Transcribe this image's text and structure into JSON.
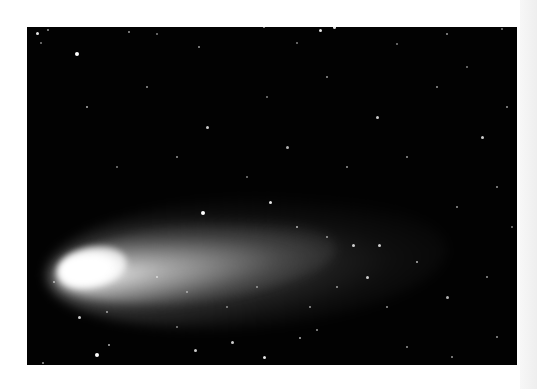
{
  "image": {
    "subject": "Comet with bright nucleus and long tail against a starfield",
    "border_color": "#ffffff",
    "sky_color": "#020202",
    "comet_color": "#ffffff"
  },
  "stars": [
    {
      "x": 10,
      "y": 6,
      "r": 1.5,
      "o": 0.9
    },
    {
      "x": 21,
      "y": 3,
      "r": 1,
      "o": 0.6
    },
    {
      "x": 50,
      "y": 27,
      "r": 2,
      "o": 1
    },
    {
      "x": 102,
      "y": 5,
      "r": 1,
      "o": 0.6
    },
    {
      "x": 130,
      "y": 7,
      "r": 1,
      "o": 0.5
    },
    {
      "x": 172,
      "y": 20,
      "r": 1,
      "o": 0.6
    },
    {
      "x": 237,
      "y": 0,
      "r": 1,
      "o": 0.7
    },
    {
      "x": 293,
      "y": 3,
      "r": 1.5,
      "o": 0.9
    },
    {
      "x": 307,
      "y": 0,
      "r": 1.5,
      "o": 0.9
    },
    {
      "x": 420,
      "y": 7,
      "r": 1,
      "o": 0.6
    },
    {
      "x": 475,
      "y": 2,
      "r": 1,
      "o": 0.5
    },
    {
      "x": 270,
      "y": 16,
      "r": 1,
      "o": 0.5
    },
    {
      "x": 370,
      "y": 17,
      "r": 1,
      "o": 0.5
    },
    {
      "x": 14,
      "y": 16,
      "r": 1,
      "o": 0.5
    },
    {
      "x": 60,
      "y": 80,
      "r": 1,
      "o": 0.7
    },
    {
      "x": 120,
      "y": 60,
      "r": 1,
      "o": 0.6
    },
    {
      "x": 180,
      "y": 100,
      "r": 1.5,
      "o": 0.8
    },
    {
      "x": 240,
      "y": 70,
      "r": 1,
      "o": 0.5
    },
    {
      "x": 300,
      "y": 50,
      "r": 1,
      "o": 0.6
    },
    {
      "x": 350,
      "y": 90,
      "r": 1.5,
      "o": 0.8
    },
    {
      "x": 410,
      "y": 60,
      "r": 1,
      "o": 0.6
    },
    {
      "x": 455,
      "y": 110,
      "r": 1.5,
      "o": 0.8
    },
    {
      "x": 470,
      "y": 160,
      "r": 1,
      "o": 0.6
    },
    {
      "x": 90,
      "y": 140,
      "r": 1,
      "o": 0.5
    },
    {
      "x": 150,
      "y": 130,
      "r": 1,
      "o": 0.6
    },
    {
      "x": 220,
      "y": 150,
      "r": 1,
      "o": 0.5
    },
    {
      "x": 260,
      "y": 120,
      "r": 1.5,
      "o": 0.7
    },
    {
      "x": 320,
      "y": 140,
      "r": 1,
      "o": 0.6
    },
    {
      "x": 380,
      "y": 130,
      "r": 1,
      "o": 0.6
    },
    {
      "x": 430,
      "y": 180,
      "r": 1,
      "o": 0.6
    },
    {
      "x": 176,
      "y": 186,
      "r": 2,
      "o": 1
    },
    {
      "x": 243,
      "y": 175,
      "r": 1.5,
      "o": 0.9
    },
    {
      "x": 270,
      "y": 200,
      "r": 1,
      "o": 0.7
    },
    {
      "x": 300,
      "y": 210,
      "r": 1,
      "o": 0.6
    },
    {
      "x": 326,
      "y": 218,
      "r": 1.5,
      "o": 0.8
    },
    {
      "x": 352,
      "y": 218,
      "r": 1.5,
      "o": 0.8
    },
    {
      "x": 390,
      "y": 235,
      "r": 1,
      "o": 0.7
    },
    {
      "x": 340,
      "y": 250,
      "r": 1.5,
      "o": 0.8
    },
    {
      "x": 310,
      "y": 260,
      "r": 1,
      "o": 0.6
    },
    {
      "x": 283,
      "y": 280,
      "r": 1,
      "o": 0.6
    },
    {
      "x": 360,
      "y": 280,
      "r": 1,
      "o": 0.6
    },
    {
      "x": 420,
      "y": 270,
      "r": 1.5,
      "o": 0.7
    },
    {
      "x": 460,
      "y": 250,
      "r": 1,
      "o": 0.6
    },
    {
      "x": 470,
      "y": 310,
      "r": 1,
      "o": 0.6
    },
    {
      "x": 27,
      "y": 255,
      "r": 1,
      "o": 0.6
    },
    {
      "x": 52,
      "y": 290,
      "r": 1.5,
      "o": 0.8
    },
    {
      "x": 80,
      "y": 285,
      "r": 1,
      "o": 0.6
    },
    {
      "x": 70,
      "y": 328,
      "r": 2,
      "o": 1
    },
    {
      "x": 82,
      "y": 318,
      "r": 1,
      "o": 0.7
    },
    {
      "x": 168,
      "y": 323,
      "r": 1.5,
      "o": 0.8
    },
    {
      "x": 205,
      "y": 315,
      "r": 1.5,
      "o": 0.8
    },
    {
      "x": 237,
      "y": 330,
      "r": 1.5,
      "o": 0.9
    },
    {
      "x": 273,
      "y": 311,
      "r": 1,
      "o": 0.7
    },
    {
      "x": 290,
      "y": 303,
      "r": 1,
      "o": 0.6
    },
    {
      "x": 380,
      "y": 320,
      "r": 1,
      "o": 0.6
    },
    {
      "x": 425,
      "y": 330,
      "r": 1,
      "o": 0.6
    },
    {
      "x": 16,
      "y": 336,
      "r": 1,
      "o": 0.6
    },
    {
      "x": 150,
      "y": 300,
      "r": 1,
      "o": 0.5
    },
    {
      "x": 200,
      "y": 280,
      "r": 1,
      "o": 0.5
    },
    {
      "x": 130,
      "y": 250,
      "r": 1,
      "o": 0.6
    },
    {
      "x": 160,
      "y": 265,
      "r": 1,
      "o": 0.5
    },
    {
      "x": 230,
      "y": 260,
      "r": 1,
      "o": 0.5
    },
    {
      "x": 480,
      "y": 80,
      "r": 1,
      "o": 0.6
    },
    {
      "x": 485,
      "y": 200,
      "r": 1,
      "o": 0.5
    },
    {
      "x": 440,
      "y": 40,
      "r": 1,
      "o": 0.5
    }
  ]
}
